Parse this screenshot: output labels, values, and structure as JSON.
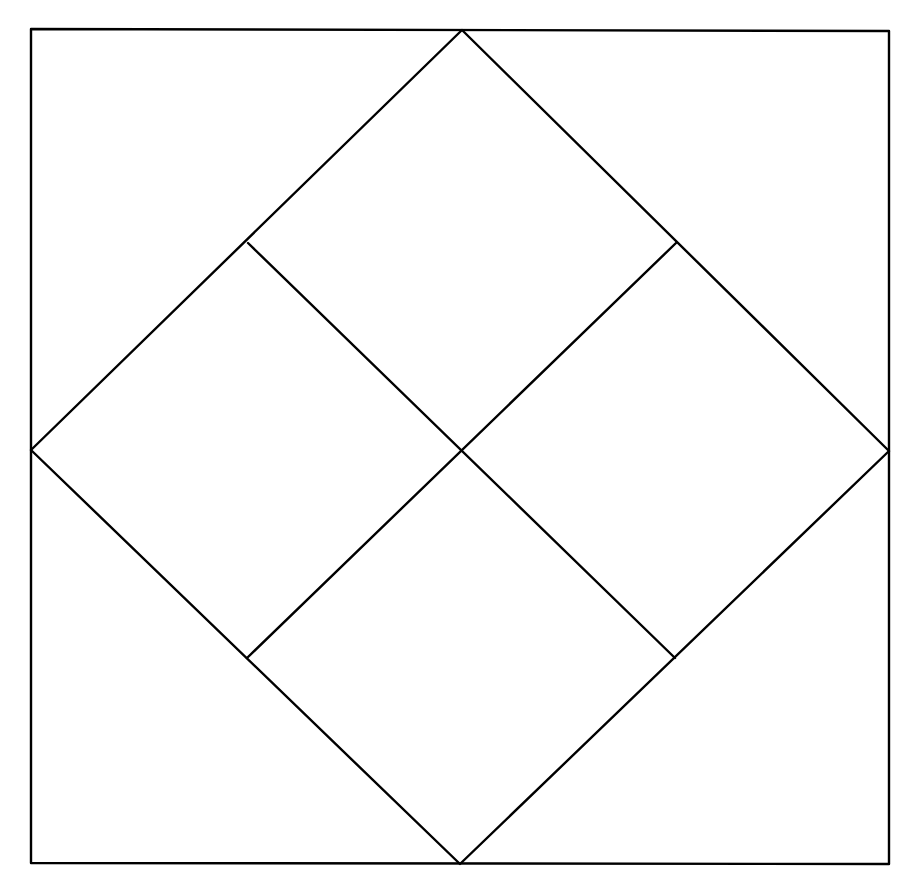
{
  "canvas": {
    "width": 912,
    "height": 876,
    "background": "#ffffff"
  },
  "style": {
    "stroke_color": "#000000",
    "stroke_width": 2.4
  },
  "outer_square": {
    "points": [
      [
        31,
        29
      ],
      [
        889,
        31
      ],
      [
        889,
        864
      ],
      [
        31,
        863
      ]
    ]
  },
  "diamond": {
    "points": [
      [
        462,
        30
      ],
      [
        889,
        451
      ],
      [
        460,
        864
      ],
      [
        31,
        450
      ]
    ]
  },
  "inner_lines": [
    {
      "name": "divider-line-nw-se",
      "from": [
        248,
        243
      ],
      "to": [
        675,
        658
      ]
    },
    {
      "name": "divider-line-ne-sw",
      "from": [
        676,
        243
      ],
      "to": [
        247,
        658
      ]
    }
  ],
  "labels": []
}
